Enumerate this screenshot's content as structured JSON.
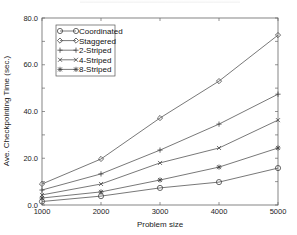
{
  "chart_data": {
    "type": "line",
    "title": "",
    "xlabel": "Problem size",
    "ylabel": "Ave. Checkpointing Time (sec.)",
    "x": [
      1000,
      2000,
      3000,
      4000,
      5000
    ],
    "xlim": [
      1000,
      5000
    ],
    "ylim": [
      0,
      80
    ],
    "x_ticks": [
      "1000",
      "2000",
      "3000",
      "4000",
      "5000"
    ],
    "y_ticks": [
      "0.0",
      "20.0",
      "40.0",
      "60.0",
      "80.0"
    ],
    "grid": false,
    "legend_position": "upper left",
    "series": [
      {
        "name": "Coordinated",
        "marker": "circle",
        "values": [
          1.5,
          3.8,
          7.3,
          9.8,
          15.8
        ]
      },
      {
        "name": "Staggered",
        "marker": "diamond",
        "values": [
          9.0,
          19.7,
          37.2,
          53.0,
          72.7
        ]
      },
      {
        "name": "2-Striped",
        "marker": "plus",
        "values": [
          6.4,
          13.3,
          23.5,
          34.6,
          47.4
        ]
      },
      {
        "name": "4-Striped",
        "marker": "x",
        "values": [
          4.3,
          9.0,
          18.0,
          24.4,
          36.3
        ]
      },
      {
        "name": "8-Striped",
        "marker": "asterisk",
        "values": [
          3.0,
          5.6,
          10.7,
          16.2,
          24.4
        ]
      }
    ]
  }
}
